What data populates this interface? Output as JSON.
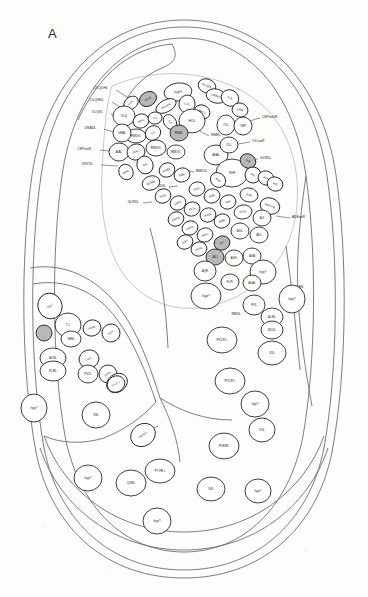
{
  "figure": {
    "panel_label": "A",
    "kind": "anatomical-cross-section-diagram",
    "background_color": "#fdfdfc",
    "outline_color": "#6e6e6e",
    "cell_outline_color": "#1c1c1c",
    "shaded_cell_fill": "#b8b8b8",
    "unshaded_cell_fill": "#ffffff"
  },
  "leader_labels": [
    {
      "text": "OLQDHL",
      "x": 108,
      "y": 88,
      "lx": 116,
      "ly": 90,
      "tx": 132,
      "ty": 100
    },
    {
      "text": "OLQHDL",
      "x": 104,
      "y": 100,
      "lx": 112,
      "ly": 102,
      "tx": 128,
      "ty": 112
    },
    {
      "text": "OLQVL",
      "x": 103,
      "y": 112,
      "lx": 111,
      "ly": 114,
      "tx": 126,
      "ty": 124
    },
    {
      "text": "URADL",
      "x": 96,
      "y": 128,
      "lx": 104,
      "ly": 129,
      "tx": 120,
      "ty": 134
    },
    {
      "text": "CEPsoVL",
      "x": 92,
      "y": 149,
      "lx": 100,
      "ly": 150,
      "tx": 118,
      "ty": 152
    },
    {
      "text": "URYVL",
      "x": 93,
      "y": 164,
      "lx": 101,
      "ly": 165,
      "tx": 118,
      "ty": 166
    },
    {
      "text": "CEPsoDR",
      "x": 262,
      "y": 117,
      "lx": 260,
      "ly": 118,
      "tx": 246,
      "ty": 122
    },
    {
      "text": "OLLsoR",
      "x": 252,
      "y": 141,
      "lx": 250,
      "ly": 142,
      "tx": 238,
      "ty": 144
    },
    {
      "text": "GLRDL",
      "x": 260,
      "y": 158,
      "lx": 258,
      "ly": 159,
      "tx": 244,
      "ty": 160
    },
    {
      "text": "ADEsoR",
      "x": 292,
      "y": 217,
      "lx": 290,
      "ly": 218,
      "tx": 276,
      "ty": 216
    },
    {
      "text": "CAN",
      "x": 296,
      "y": 287,
      "lx": 294,
      "ly": 288,
      "tx": 282,
      "ty": 292
    },
    {
      "text": "RMDL",
      "x": 241,
      "y": 314,
      "lx": 244,
      "ly": 312,
      "tx": 252,
      "ty": 308
    },
    {
      "text": "RMEL",
      "x": 211,
      "y": 135,
      "lx": 209,
      "ly": 136,
      "tx": 200,
      "ty": 131
    },
    {
      "text": "BMDVL",
      "x": 196,
      "y": 171,
      "lx": 194,
      "ly": 172,
      "tx": 185,
      "ty": 170
    },
    {
      "text": "BMDVL",
      "x": 166,
      "y": 186,
      "lx": 169,
      "ly": 187,
      "tx": 178,
      "ty": 186
    },
    {
      "text": "GLRDL",
      "x": 139,
      "y": 202,
      "lx": 143,
      "ly": 203,
      "tx": 152,
      "ty": 202
    },
    {
      "text": "PN-SDL",
      "x": 147,
      "y": 432,
      "lx": 150,
      "ly": 430,
      "tx": 158,
      "ty": 426
    }
  ],
  "cells": [
    {
      "label": "hyp4",
      "cx": 178,
      "cy": 92,
      "rx": 14,
      "ry": 9,
      "rot": -8,
      "shaded": false,
      "fs": 3.6
    },
    {
      "label": "OLQDL",
      "cx": 207,
      "cy": 86,
      "rx": 9,
      "ry": 7,
      "rot": 20,
      "shaded": false,
      "fs": 3.2
    },
    {
      "label": "URAVL",
      "cx": 216,
      "cy": 96,
      "rx": 10,
      "ry": 7,
      "rot": 15,
      "shaded": false,
      "fs": 3.2
    },
    {
      "label": "OLQ",
      "cx": 148,
      "cy": 99,
      "rx": 9,
      "ry": 7,
      "rot": -30,
      "shaded": true,
      "fs": 3.2
    },
    {
      "label": "RIPL",
      "cx": 131,
      "cy": 103,
      "rx": 8,
      "ry": 6,
      "rot": -40,
      "shaded": false,
      "fs": 3.0
    },
    {
      "label": "OLLsoL",
      "cx": 166,
      "cy": 106,
      "rx": 11,
      "ry": 6,
      "rot": -28,
      "shaded": false,
      "fs": 3.0
    },
    {
      "label": "IL1L",
      "cx": 187,
      "cy": 104,
      "rx": 8,
      "ry": 9,
      "rot": 10,
      "shaded": false,
      "fs": 3.0
    },
    {
      "label": "RMEL",
      "cx": 202,
      "cy": 112,
      "rx": 8,
      "ry": 7,
      "rot": 25,
      "shaded": false,
      "fs": 3.0
    },
    {
      "label": "IL2L",
      "cx": 230,
      "cy": 98,
      "rx": 9,
      "ry": 8,
      "rot": 30,
      "shaded": false,
      "fs": 3.0
    },
    {
      "label": "URB",
      "cx": 240,
      "cy": 110,
      "rx": 8,
      "ry": 7,
      "rot": 15,
      "shaded": false,
      "fs": 3.0
    },
    {
      "label": "OLQ",
      "cx": 124,
      "cy": 116,
      "rx": 11,
      "ry": 10,
      "rot": 0,
      "shaded": false,
      "fs": 3.0
    },
    {
      "label": "AWC",
      "cx": 141,
      "cy": 121,
      "rx": 8,
      "ry": 7,
      "rot": -20,
      "shaded": false,
      "fs": 3.0
    },
    {
      "label": "IL1",
      "cx": 155,
      "cy": 118,
      "rx": 7,
      "ry": 6,
      "rot": -10,
      "shaded": false,
      "fs": 2.9
    },
    {
      "label": "HOL",
      "cx": 192,
      "cy": 121,
      "rx": 13,
      "ry": 12,
      "rot": 0,
      "shaded": false,
      "fs": 3.4
    },
    {
      "label": "IL2",
      "cx": 170,
      "cy": 122,
      "rx": 8,
      "ry": 6,
      "rot": 55,
      "shaded": false,
      "fs": 2.9
    },
    {
      "label": "OLL",
      "cx": 226,
      "cy": 125,
      "rx": 9,
      "ry": 10,
      "rot": 0,
      "shaded": false,
      "fs": 3.0
    },
    {
      "label": "CEP",
      "cx": 243,
      "cy": 126,
      "rx": 9,
      "ry": 9,
      "rot": 0,
      "shaded": false,
      "fs": 3.0
    },
    {
      "label": "RMDVL",
      "cx": 136,
      "cy": 136,
      "rx": 10,
      "ry": 7,
      "rot": 0,
      "shaded": false,
      "fs": 3.0
    },
    {
      "label": "URAL",
      "cx": 122,
      "cy": 133,
      "rx": 9,
      "ry": 9,
      "rot": 0,
      "shaded": false,
      "fs": 3.0
    },
    {
      "label": "IL1",
      "cx": 153,
      "cy": 133,
      "rx": 8,
      "ry": 7,
      "rot": -35,
      "shaded": false,
      "fs": 2.9
    },
    {
      "label": "RMEL",
      "cx": 179,
      "cy": 133,
      "rx": 9,
      "ry": 8,
      "rot": 0,
      "shaded": true,
      "fs": 3.0
    },
    {
      "label": "AVAL",
      "cx": 216,
      "cy": 155,
      "rx": 12,
      "ry": 10,
      "rot": 0,
      "shaded": false,
      "fs": 3.2
    },
    {
      "label": "OLL",
      "cx": 229,
      "cy": 145,
      "rx": 9,
      "ry": 8,
      "rot": 0,
      "shaded": false,
      "fs": 3.0
    },
    {
      "label": "AIAL",
      "cx": 119,
      "cy": 152,
      "rx": 10,
      "ry": 9,
      "rot": 0,
      "shaded": false,
      "fs": 3.0
    },
    {
      "label": "RIAL",
      "cx": 136,
      "cy": 152,
      "rx": 9,
      "ry": 8,
      "rot": -15,
      "shaded": false,
      "fs": 3.0
    },
    {
      "label": "RMDVL",
      "cx": 156,
      "cy": 148,
      "rx": 10,
      "ry": 8,
      "rot": 0,
      "shaded": false,
      "fs": 3.0
    },
    {
      "label": "BMDVL",
      "cx": 176,
      "cy": 152,
      "rx": 9,
      "ry": 7,
      "rot": 0,
      "shaded": false,
      "fs": 2.9
    },
    {
      "label": "RIH",
      "cx": 232,
      "cy": 173,
      "rx": 16,
      "ry": 14,
      "rot": 0,
      "shaded": false,
      "fs": 3.6
    },
    {
      "label": "AIB",
      "cx": 248,
      "cy": 161,
      "rx": 8,
      "ry": 7,
      "rot": 30,
      "shaded": true,
      "fs": 3.0
    },
    {
      "label": "AVL",
      "cx": 253,
      "cy": 175,
      "rx": 8,
      "ry": 8,
      "rot": 30,
      "shaded": false,
      "fs": 3.0
    },
    {
      "label": "ADA",
      "cx": 218,
      "cy": 180,
      "rx": 8,
      "ry": 7,
      "rot": 40,
      "shaded": false,
      "fs": 2.9
    },
    {
      "label": "ASK",
      "cx": 266,
      "cy": 178,
      "rx": 8,
      "ry": 7,
      "rot": 20,
      "shaded": false,
      "fs": 2.9
    },
    {
      "label": "AIN",
      "cx": 275,
      "cy": 184,
      "rx": 8,
      "ry": 7,
      "rot": 20,
      "shaded": false,
      "fs": 2.9
    },
    {
      "label": "ASE",
      "cx": 249,
      "cy": 195,
      "rx": 9,
      "ry": 7,
      "rot": 10,
      "shaded": false,
      "fs": 2.9
    },
    {
      "label": "ADEsoR",
      "cx": 270,
      "cy": 206,
      "rx": 10,
      "ry": 8,
      "rot": 20,
      "shaded": false,
      "fs": 2.9
    },
    {
      "label": "RIS",
      "cx": 145,
      "cy": 165,
      "rx": 8,
      "ry": 9,
      "rot": -20,
      "shaded": false,
      "fs": 2.9
    },
    {
      "label": "RIML",
      "cx": 126,
      "cy": 172,
      "rx": 7,
      "ry": 8,
      "rot": -30,
      "shaded": false,
      "fs": 2.9
    },
    {
      "label": "GLRDL",
      "cx": 151,
      "cy": 183,
      "rx": 9,
      "ry": 7,
      "rot": -20,
      "shaded": false,
      "fs": 2.9
    },
    {
      "label": "RMDL",
      "cx": 167,
      "cy": 170,
      "rx": 8,
      "ry": 7,
      "rot": -25,
      "shaded": false,
      "fs": 2.9
    },
    {
      "label": "RIBL",
      "cx": 182,
      "cy": 175,
      "rx": 8,
      "ry": 7,
      "rot": -20,
      "shaded": false,
      "fs": 2.9
    },
    {
      "label": "AVEL",
      "cx": 197,
      "cy": 189,
      "rx": 8,
      "ry": 7,
      "rot": -15,
      "shaded": false,
      "fs": 2.9
    },
    {
      "label": "SIBL",
      "cx": 212,
      "cy": 196,
      "rx": 8,
      "ry": 7,
      "rot": -20,
      "shaded": false,
      "fs": 2.9
    },
    {
      "label": "AIM",
      "cx": 228,
      "cy": 202,
      "rx": 8,
      "ry": 7,
      "rot": -20,
      "shaded": false,
      "fs": 2.9
    },
    {
      "label": "ASGL",
      "cx": 243,
      "cy": 212,
      "rx": 9,
      "ry": 7,
      "rot": -10,
      "shaded": false,
      "fs": 2.9
    },
    {
      "label": "AIZ",
      "cx": 262,
      "cy": 218,
      "rx": 9,
      "ry": 8,
      "rot": 0,
      "shaded": false,
      "fs": 2.9
    },
    {
      "label": "RIGL",
      "cx": 163,
      "cy": 196,
      "rx": 8,
      "ry": 7,
      "rot": -25,
      "shaded": false,
      "fs": 2.9
    },
    {
      "label": "SMDL",
      "cx": 178,
      "cy": 203,
      "rx": 8,
      "ry": 7,
      "rot": -25,
      "shaded": false,
      "fs": 2.9
    },
    {
      "label": "AVJL",
      "cx": 192,
      "cy": 209,
      "rx": 8,
      "ry": 7,
      "rot": -20,
      "shaded": false,
      "fs": 2.9
    },
    {
      "label": "AVDL",
      "cx": 208,
      "cy": 215,
      "rx": 8,
      "ry": 7,
      "rot": -20,
      "shaded": false,
      "fs": 2.9
    },
    {
      "label": "AVBL",
      "cx": 222,
      "cy": 221,
      "rx": 8,
      "ry": 7,
      "rot": -20,
      "shaded": false,
      "fs": 2.9
    },
    {
      "label": "ASIL",
      "cx": 240,
      "cy": 231,
      "rx": 9,
      "ry": 8,
      "rot": 0,
      "shaded": false,
      "fs": 2.9
    },
    {
      "label": "ADL",
      "cx": 259,
      "cy": 235,
      "rx": 9,
      "ry": 8,
      "rot": 0,
      "shaded": false,
      "fs": 2.9
    },
    {
      "label": "SAADL",
      "cx": 176,
      "cy": 219,
      "rx": 8,
      "ry": 7,
      "rot": -25,
      "shaded": false,
      "fs": 2.8
    },
    {
      "label": "RMGL",
      "cx": 190,
      "cy": 228,
      "rx": 8,
      "ry": 7,
      "rot": -25,
      "shaded": false,
      "fs": 2.8
    },
    {
      "label": "AVKL",
      "cx": 205,
      "cy": 235,
      "rx": 8,
      "ry": 7,
      "rot": -20,
      "shaded": false,
      "fs": 2.8
    },
    {
      "label": "AIY",
      "cx": 222,
      "cy": 243,
      "rx": 8,
      "ry": 7,
      "rot": -20,
      "shaded": true,
      "fs": 2.8
    },
    {
      "label": "ASH",
      "cx": 185,
      "cy": 242,
      "rx": 8,
      "ry": 7,
      "rot": -25,
      "shaded": false,
      "fs": 2.8
    },
    {
      "label": "AUAL",
      "cx": 199,
      "cy": 249,
      "rx": 8,
      "ry": 7,
      "rot": -20,
      "shaded": false,
      "fs": 2.8
    },
    {
      "label": "ASJ",
      "cx": 215,
      "cy": 257,
      "rx": 9,
      "ry": 8,
      "rot": 0,
      "shaded": true,
      "fs": 2.8
    },
    {
      "label": "ADFL",
      "cx": 234,
      "cy": 258,
      "rx": 9,
      "ry": 8,
      "rot": 0,
      "shaded": false,
      "fs": 2.8
    },
    {
      "label": "AWA",
      "cx": 252,
      "cy": 256,
      "rx": 9,
      "ry": 8,
      "rot": 0,
      "shaded": false,
      "fs": 2.8
    },
    {
      "label": "AQR",
      "cx": 205,
      "cy": 271,
      "rx": 11,
      "ry": 10,
      "rot": 0,
      "shaded": false,
      "fs": 3.0
    },
    {
      "label": "hyp?",
      "cx": 263,
      "cy": 272,
      "rx": 13,
      "ry": 12,
      "rot": 0,
      "shaded": false,
      "fs": 3.2
    },
    {
      "label": "FLPL",
      "cx": 230,
      "cy": 282,
      "rx": 9,
      "ry": 8,
      "rot": 0,
      "shaded": false,
      "fs": 2.9
    },
    {
      "label": "ADAL",
      "cx": 252,
      "cy": 283,
      "rx": 9,
      "ry": 8,
      "rot": 0,
      "shaded": false,
      "fs": 2.9
    },
    {
      "label": "hyp?",
      "cx": 206,
      "cy": 296,
      "rx": 15,
      "ry": 13,
      "rot": 0,
      "shaded": false,
      "fs": 3.4
    },
    {
      "label": "PVL",
      "cx": 254,
      "cy": 305,
      "rx": 11,
      "ry": 10,
      "rot": 0,
      "shaded": false,
      "fs": 3.0
    },
    {
      "label": "hyp?",
      "cx": 292,
      "cy": 299,
      "rx": 13,
      "ry": 14,
      "rot": 0,
      "shaded": false,
      "fs": 3.2
    },
    {
      "label": "ALML",
      "cx": 272,
      "cy": 317,
      "rx": 11,
      "ry": 9,
      "rot": 0,
      "shaded": false,
      "fs": 3.0
    },
    {
      "label": "BDUL",
      "cx": 272,
      "cy": 330,
      "rx": 11,
      "ry": 9,
      "rot": 0,
      "shaded": false,
      "fs": 3.0
    },
    {
      "label": "PVCR L",
      "cx": 222,
      "cy": 340,
      "rx": 15,
      "ry": 13,
      "rot": 0,
      "shaded": false,
      "fs": 3.0
    },
    {
      "label": "V2L",
      "cx": 272,
      "cy": 353,
      "rx": 14,
      "ry": 12,
      "rot": 0,
      "shaded": false,
      "fs": 3.2
    },
    {
      "label": "hyp?",
      "cx": 50,
      "cy": 306,
      "rx": 12,
      "ry": 13,
      "rot": -25,
      "shaded": false,
      "fs": 3.0
    },
    {
      "label": "T L",
      "cx": 68,
      "cy": 325,
      "rx": 13,
      "ry": 12,
      "rot": 0,
      "shaded": false,
      "fs": 3.2
    },
    {
      "label": "",
      "cx": 44,
      "cy": 333,
      "rx": 8,
      "ry": 8,
      "rot": 0,
      "shaded": true,
      "fs": 2.8
    },
    {
      "label": "VBNL",
      "cx": 71,
      "cy": 339,
      "rx": 10,
      "ry": 8,
      "rot": 0,
      "shaded": false,
      "fs": 2.9
    },
    {
      "label": "PQRL",
      "cx": 92,
      "cy": 328,
      "rx": 9,
      "ry": 8,
      "rot": -20,
      "shaded": false,
      "fs": 2.8
    },
    {
      "label": "PVR",
      "cx": 111,
      "cy": 333,
      "rx": 9,
      "ry": 9,
      "rot": -35,
      "shaded": false,
      "fs": 2.8
    },
    {
      "label": "ALNL",
      "cx": 53,
      "cy": 358,
      "rx": 13,
      "ry": 10,
      "rot": 0,
      "shaded": false,
      "fs": 3.0
    },
    {
      "label": "PLML",
      "cx": 53,
      "cy": 371,
      "rx": 13,
      "ry": 10,
      "rot": 0,
      "shaded": false,
      "fs": 3.0
    },
    {
      "label": "LUAL",
      "cx": 89,
      "cy": 359,
      "rx": 10,
      "ry": 9,
      "rot": -15,
      "shaded": false,
      "fs": 2.8
    },
    {
      "label": "PVCL",
      "cx": 88,
      "cy": 374,
      "rx": 10,
      "ry": 9,
      "rot": 0,
      "shaded": false,
      "fs": 2.8
    },
    {
      "label": "PVQL",
      "cx": 108,
      "cy": 374,
      "rx": 9,
      "ry": 9,
      "rot": -40,
      "shaded": false,
      "fs": 2.8
    },
    {
      "label": "PHC? L",
      "cx": 117,
      "cy": 383,
      "rx": 11,
      "ry": 9,
      "rot": -35,
      "shaded": false,
      "fs": 2.8
    },
    {
      "label": "PVJ? L",
      "cx": 116,
      "cy": 384,
      "rx": 9,
      "ry": 8,
      "rot": -30,
      "shaded": false,
      "fs": 2.7
    },
    {
      "label": "hyp?",
      "cx": 34,
      "cy": 408,
      "rx": 13,
      "ry": 14,
      "rot": 0,
      "shaded": false,
      "fs": 3.2
    },
    {
      "label": "V8L",
      "cx": 96,
      "cy": 415,
      "rx": 14,
      "ry": 13,
      "rot": 0,
      "shaded": false,
      "fs": 3.2
    },
    {
      "label": "PN-SDL",
      "cx": 143,
      "cy": 435,
      "rx": 13,
      "ry": 11,
      "rot": -35,
      "shaded": false,
      "fs": 2.8
    },
    {
      "label": "hyp?",
      "cx": 255,
      "cy": 404,
      "rx": 14,
      "ry": 13,
      "rot": 0,
      "shaded": false,
      "fs": 3.2
    },
    {
      "label": "PVCR L",
      "cx": 230,
      "cy": 381,
      "rx": 15,
      "ry": 13,
      "rot": 0,
      "shaded": false,
      "fs": 3.0
    },
    {
      "label": "V3L",
      "cx": 262,
      "cy": 430,
      "rx": 13,
      "ry": 12,
      "rot": 0,
      "shaded": false,
      "fs": 3.2
    },
    {
      "label": "PVB/BL",
      "cx": 224,
      "cy": 446,
      "rx": 15,
      "ry": 13,
      "rot": 0,
      "shaded": false,
      "fs": 3.0
    },
    {
      "label": "PT-FB L",
      "cx": 160,
      "cy": 471,
      "rx": 15,
      "ry": 12,
      "rot": 0,
      "shaded": false,
      "fs": 2.9
    },
    {
      "label": "hyp?",
      "cx": 88,
      "cy": 478,
      "rx": 14,
      "ry": 13,
      "rot": 0,
      "shaded": false,
      "fs": 3.2
    },
    {
      "label": "QVBL",
      "cx": 131,
      "cy": 483,
      "rx": 15,
      "ry": 13,
      "rot": 0,
      "shaded": false,
      "fs": 3.2
    },
    {
      "label": "V4L",
      "cx": 211,
      "cy": 489,
      "rx": 14,
      "ry": 12,
      "rot": 0,
      "shaded": false,
      "fs": 3.2
    },
    {
      "label": "hyp?",
      "cx": 258,
      "cy": 491,
      "rx": 13,
      "ry": 12,
      "rot": 0,
      "shaded": false,
      "fs": 3.2
    },
    {
      "label": "hyp?",
      "cx": 157,
      "cy": 521,
      "rx": 14,
      "ry": 13,
      "rot": 0,
      "shaded": false,
      "fs": 3.2
    }
  ]
}
